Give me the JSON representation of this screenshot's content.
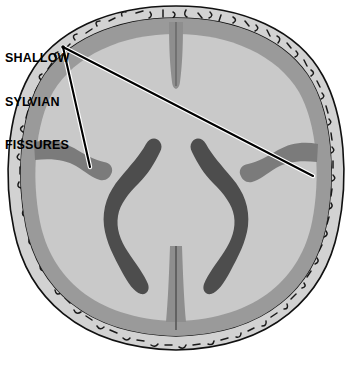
{
  "figure": {
    "width": 352,
    "height": 365,
    "background_color": "#ffffff"
  },
  "annotation": {
    "label_lines": [
      "SHALLOW",
      "SYLVIAN",
      "FISSURES"
    ],
    "label_full": "SHALLOW SYLVIAN FISSURES",
    "text_color": "#000000",
    "leader_color": "#000000",
    "leader_outline_color": "#ffffff",
    "vertex": {
      "x": 63,
      "y": 47
    },
    "targets": [
      {
        "name": "left-sylvian-fissure",
        "x": 90,
        "y": 167
      },
      {
        "name": "right-sylvian-fissure",
        "x": 313,
        "y": 176
      }
    ]
  },
  "anatomy": {
    "skull": {
      "label": "skull",
      "fill_color": "#d2d2d2",
      "outline_color": "#111111",
      "texture": "diploe-marks"
    },
    "cortex": {
      "label": "cerebral cortex ribbon",
      "fill_color": "#9a9a9a"
    },
    "parenchyma": {
      "label": "brain parenchyma",
      "fill_color": "#c9c9c9"
    },
    "ventricles": {
      "label": "lateral ventricles",
      "fill_color": "#4d4d4d",
      "count": 2,
      "shape": "s-curved"
    },
    "interhemispheric_fissure": {
      "label": "interhemispheric fissure",
      "fill_color": "#8e8e8e",
      "center_line_color": "#5e5e5e"
    },
    "sylvian_fissures": {
      "label": "sylvian fissures",
      "fill_color": "#7b7b7b",
      "count": 2,
      "description": "shallow lateral notches"
    }
  }
}
